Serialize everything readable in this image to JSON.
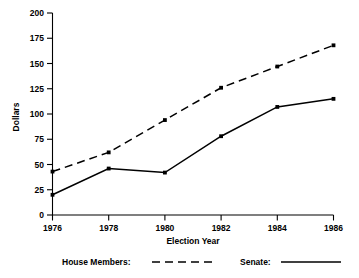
{
  "chart_data": {
    "type": "line",
    "title": "",
    "subtitle": "",
    "xlabel": "Election Year",
    "ylabel": "Dollars",
    "x": [
      1976,
      1978,
      1980,
      1982,
      1984,
      1986
    ],
    "xticklabels": [
      "1976",
      "1978",
      "1980",
      "1982",
      "1984",
      "1986"
    ],
    "xlim": [
      1976,
      1986
    ],
    "ylim": [
      0,
      200
    ],
    "yticks": [
      0,
      25,
      50,
      75,
      100,
      125,
      150,
      175,
      200
    ],
    "yticklabels": [
      "0",
      "25",
      "50",
      "75",
      "100",
      "125",
      "150",
      "175",
      "200"
    ],
    "grid": false,
    "legend_position": "below-axis",
    "series": [
      {
        "name": "House Members:",
        "style": "dashed",
        "color": "#000000",
        "values": [
          43,
          62,
          94,
          126,
          147,
          168
        ]
      },
      {
        "name": "Senate:",
        "style": "solid",
        "color": "#000000",
        "values": [
          20,
          46,
          42,
          78,
          107,
          115
        ]
      }
    ]
  },
  "legend": {
    "house_label": "House Members:",
    "senate_label": "Senate:"
  },
  "axes": {
    "y_title": "Dollars",
    "x_title": "Election Year"
  }
}
